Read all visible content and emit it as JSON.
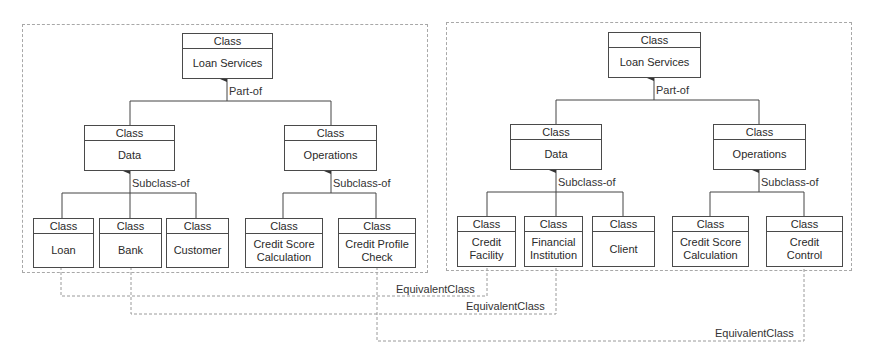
{
  "diagram": {
    "left": {
      "root": {
        "stereotype": "Class",
        "name": "Loan Services"
      },
      "root_relation": "Part-of",
      "data": {
        "stereotype": "Class",
        "name": "Data"
      },
      "operations": {
        "stereotype": "Class",
        "name": "Operations"
      },
      "data_relation": "Subclass-of",
      "operations_relation": "Subclass-of",
      "leaves": [
        {
          "stereotype": "Class",
          "name": "Loan"
        },
        {
          "stereotype": "Class",
          "name": "Bank"
        },
        {
          "stereotype": "Class",
          "name": "Customer"
        },
        {
          "stereotype": "Class",
          "name": "Credit Score\nCalculation"
        },
        {
          "stereotype": "Class",
          "name": "Credit Profile\nCheck"
        }
      ]
    },
    "right": {
      "root": {
        "stereotype": "Class",
        "name": "Loan Services"
      },
      "root_relation": "Part-of",
      "data": {
        "stereotype": "Class",
        "name": "Data"
      },
      "operations": {
        "stereotype": "Class",
        "name": "Operations"
      },
      "data_relation": "Subclass-of",
      "operations_relation": "Subclass-of",
      "leaves": [
        {
          "stereotype": "Class",
          "name": "Credit\nFacility"
        },
        {
          "stereotype": "Class",
          "name": "Financial\nInstitution"
        },
        {
          "stereotype": "Class",
          "name": "Client"
        },
        {
          "stereotype": "Class",
          "name": "Credit Score\nCalculation"
        },
        {
          "stereotype": "Class",
          "name": "Credit\nControl"
        }
      ]
    },
    "equivalences": [
      {
        "label": "EquivalentClass",
        "from": "Loan",
        "to": "Credit Facility"
      },
      {
        "label": "EquivalentClass",
        "from": "Bank",
        "to": "Financial Institution"
      },
      {
        "label": "EquivalentClass",
        "from": "Credit Profile Check",
        "to": "Credit Control"
      }
    ]
  }
}
